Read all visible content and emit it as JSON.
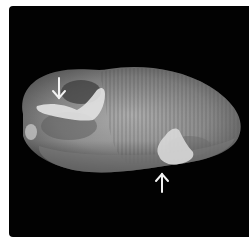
{
  "image": {
    "subject": "potato tuber",
    "background_color": "#020202",
    "frame_color": "#ffffff",
    "tuber_base_color": "#8a8a8a",
    "lesion_color": "#e2e2e2",
    "arrow_color": "#f2f2f2"
  },
  "annotations": [
    {
      "name": "arrow-top-left",
      "direction": "down"
    },
    {
      "name": "arrow-bottom-right",
      "direction": "up"
    }
  ]
}
